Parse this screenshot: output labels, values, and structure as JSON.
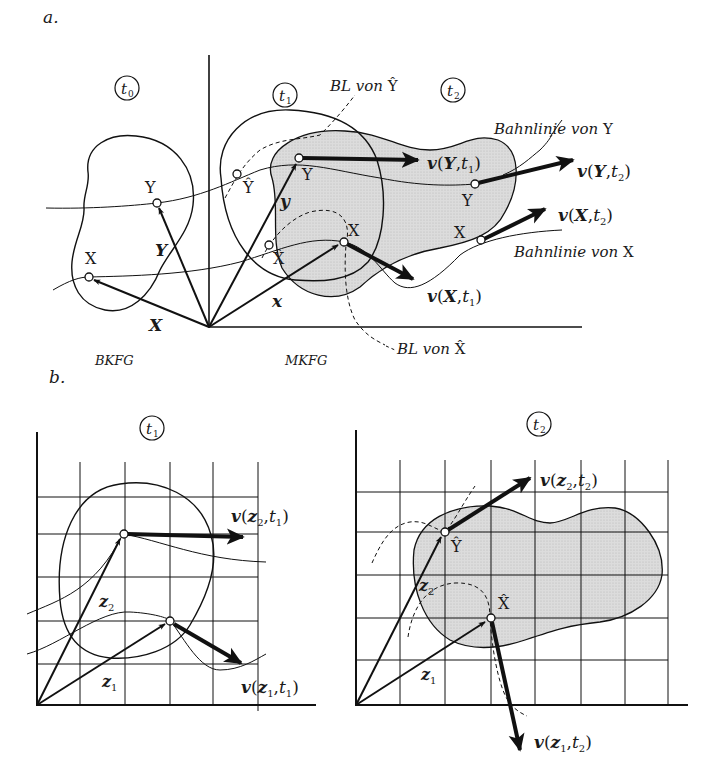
{
  "figure": {
    "colors": {
      "ink": "#111111",
      "body_fill": "#d9d9d9",
      "background": "#ffffff"
    },
    "panel_a": {
      "label": "a.",
      "time_markers": {
        "t0": "t",
        "t0_sub": "0",
        "t1": "t",
        "t1_sub": "1",
        "t2": "t",
        "t2_sub": "2"
      },
      "config_labels": {
        "reference": "BKFG",
        "current": "MKFG"
      },
      "points": {
        "Y_ref": "Y",
        "X_ref": "X",
        "Y_t1": "Y",
        "X_t1": "X",
        "Y_hat": "Ŷ",
        "X_hat": "X̂",
        "Y_t2": "Y",
        "X_t2": "X"
      },
      "vectors": {
        "Y_ref": "Y",
        "X_ref": "X",
        "y": "y",
        "x": "x"
      },
      "velocity_labels": {
        "v_Y_t1": {
          "v": "v",
          "open": "(",
          "arg": "Y",
          "sep": ",",
          "t": "t",
          "sub": "1",
          "close": ")"
        },
        "v_Y_t2": {
          "v": "v",
          "open": "(",
          "arg": "Y",
          "sep": ",",
          "t": "t",
          "sub": "2",
          "close": ")"
        },
        "v_X_t1": {
          "v": "v",
          "open": "(",
          "arg": "X",
          "sep": ",",
          "t": "t",
          "sub": "1",
          "close": ")"
        },
        "v_X_t2": {
          "v": "v",
          "open": "(",
          "arg": "X",
          "sep": ",",
          "t": "t",
          "sub": "2",
          "close": ")"
        }
      },
      "annotations": {
        "bl_y_hat": {
          "text": "BL von ",
          "sym": "Ŷ"
        },
        "bl_x_hat": {
          "text": "BL von ",
          "sym": "X̂"
        },
        "pathline_y": {
          "text": "Bahnlinie von ",
          "sym": "Y"
        },
        "pathline_x": {
          "text": "Bahnlinie von ",
          "sym": "X"
        }
      }
    },
    "panel_b": {
      "label": "b.",
      "left": {
        "time": "t",
        "time_sub": "1",
        "vectors": {
          "z1": "z",
          "z1_sub": "1",
          "z2": "z",
          "z2_sub": "2"
        },
        "velocity_labels": {
          "v_z2_t1": {
            "v": "v",
            "open": "(",
            "z": "z",
            "zsub": "2",
            "sep": ",",
            "t": "t",
            "sub": "1",
            "close": ")"
          },
          "v_z1_t1": {
            "v": "v",
            "open": "(",
            "z": "z",
            "zsub": "1",
            "sep": ",",
            "t": "t",
            "sub": "1",
            "close": ")"
          }
        }
      },
      "right": {
        "time": "t",
        "time_sub": "2",
        "points": {
          "Y_hat": "Ŷ",
          "X_hat": "X̂"
        },
        "vectors": {
          "z1": "z",
          "z1_sub": "1",
          "z2": "z",
          "z2_sub": "2"
        },
        "velocity_labels": {
          "v_z2_t2": {
            "v": "v",
            "open": "(",
            "z": "z",
            "zsub": "2",
            "sep": ",",
            "t": "t",
            "sub": "2",
            "close": ")"
          },
          "v_z1_t2": {
            "v": "v",
            "open": "(",
            "z": "z",
            "zsub": "1",
            "sep": ",",
            "t": "t",
            "sub": "2",
            "close": ")"
          }
        }
      }
    }
  }
}
